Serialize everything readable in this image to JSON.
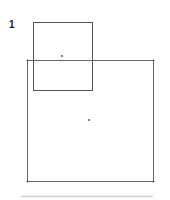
{
  "figure": {
    "label": "1",
    "shapes": [
      {
        "name": "small-square",
        "x": 33,
        "y": 22,
        "w": 59,
        "h": 68,
        "center": [
          62,
          56
        ]
      },
      {
        "name": "large-square",
        "x": 27,
        "y": 60,
        "w": 126,
        "h": 121,
        "center": [
          89,
          120
        ]
      }
    ],
    "stroke_color": "#555555",
    "separator_color": "#cccccc"
  }
}
